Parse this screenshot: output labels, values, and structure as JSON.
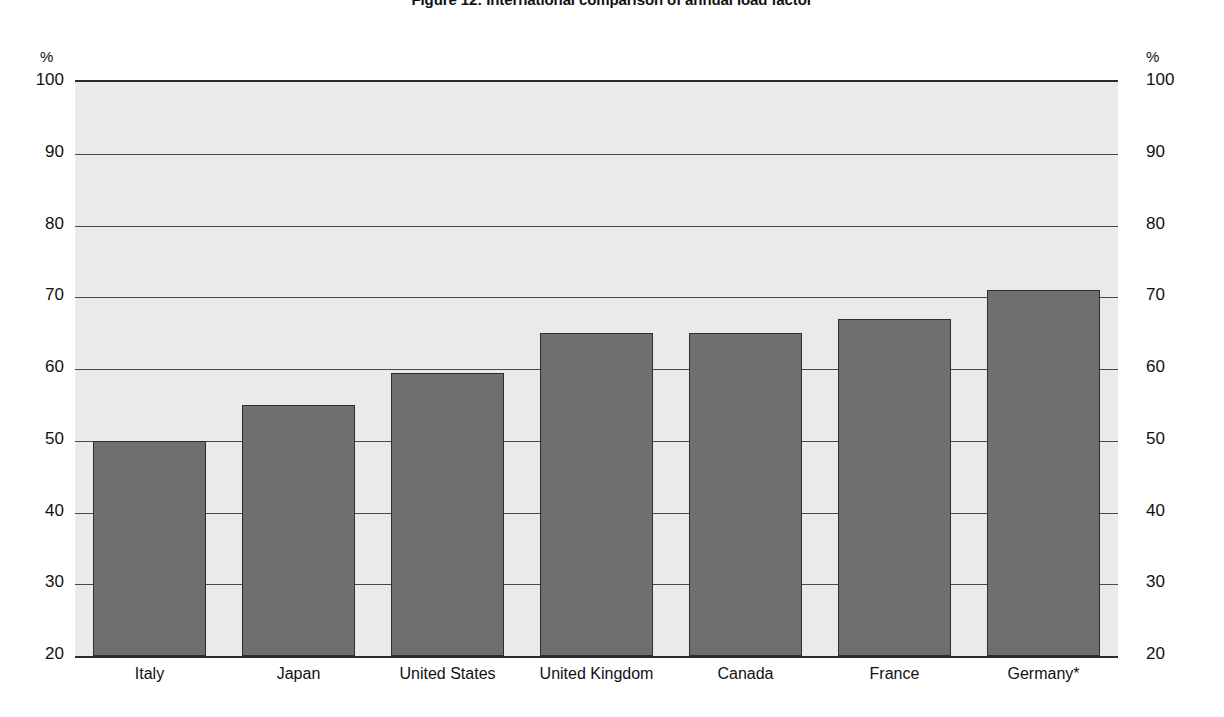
{
  "chart_data": {
    "type": "bar",
    "title": "Figure 12:  International comparison of annual load factor",
    "xlabel": "",
    "ylabel": "%",
    "ylim": [
      20,
      100
    ],
    "ytick_step": 10,
    "grid": true,
    "legend": null,
    "unit_label_left": "%",
    "unit_label_right": "%",
    "categories": [
      "Italy",
      "Japan",
      "United States",
      "United Kingdom",
      "Canada",
      "France",
      "Germany*"
    ],
    "values": [
      50,
      55,
      59.5,
      65,
      65,
      67,
      71
    ],
    "yticks": [
      100,
      90,
      80,
      70,
      60,
      50,
      40,
      30,
      20
    ],
    "ytick_labels": [
      "100",
      "90",
      "80",
      "70",
      "60",
      "50",
      "40",
      "30",
      "20"
    ],
    "footnote_marker": "*",
    "colors": {
      "bar_fill": "#6f6f6f",
      "bar_border": "#2e2e2e",
      "plot_background": "#eaeaea",
      "gridline": "#4a4a4a",
      "axis": "#2c2c2c",
      "text": "#111111",
      "page_background": "#ffffff"
    }
  }
}
